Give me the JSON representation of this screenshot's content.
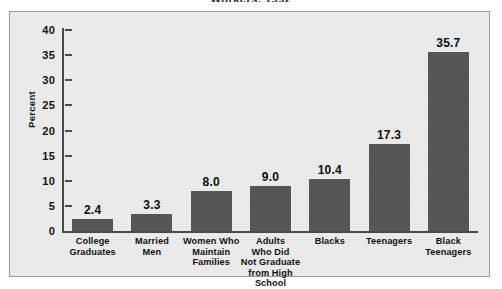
{
  "title_partial": "Workers, 1992",
  "chart_data": {
    "type": "bar",
    "title": "Workers, 1992",
    "xlabel": "",
    "ylabel": "Percent",
    "ylim": [
      0,
      40
    ],
    "yticks": [
      0,
      5,
      10,
      15,
      20,
      25,
      30,
      35,
      40
    ],
    "ytick_labels": [
      "0",
      "5",
      "10",
      "15",
      "20",
      "25",
      "30",
      "35",
      "40"
    ],
    "grid": false,
    "legend": "none",
    "bar_color": "#565656",
    "plot_background": "#ececec",
    "categories": [
      "College\nGraduates",
      "Married\nMen",
      "Women Who\nMaintain\nFamilies",
      "Adults\nWho Did\nNot Graduate\nfrom High School",
      "Blacks",
      "Teenagers",
      "Black\nTeenagers"
    ],
    "category_lines": [
      [
        "College",
        "Graduates"
      ],
      [
        "Married",
        "Men"
      ],
      [
        "Women Who",
        "Maintain",
        "Families"
      ],
      [
        "Adults",
        "Who Did",
        "Not Graduate",
        "from High School"
      ],
      [
        "Blacks"
      ],
      [
        "Teenagers"
      ],
      [
        "Black",
        "Teenagers"
      ]
    ],
    "values": [
      2.4,
      3.3,
      8.0,
      9.0,
      10.4,
      17.3,
      35.7
    ],
    "value_labels": [
      "2.4",
      "3.3",
      "8.0",
      "9.0",
      "10.4",
      "17.3",
      "35.7"
    ]
  }
}
